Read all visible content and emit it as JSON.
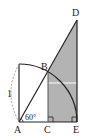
{
  "diagram": {
    "type": "geometry",
    "points": {
      "A": {
        "label": "A",
        "x": 19,
        "y": 122
      },
      "B": {
        "label": "B",
        "x": 48,
        "y": 72
      },
      "C": {
        "label": "C",
        "x": 48,
        "y": 122
      },
      "D": {
        "label": "D",
        "x": 77,
        "y": 20
      },
      "E": {
        "label": "E",
        "x": 77,
        "y": 122
      }
    },
    "angle_label": "60°",
    "side_label": "1",
    "colors": {
      "shade": "#b3b3b3",
      "line": "#222222",
      "dashed": "#999999"
    }
  }
}
